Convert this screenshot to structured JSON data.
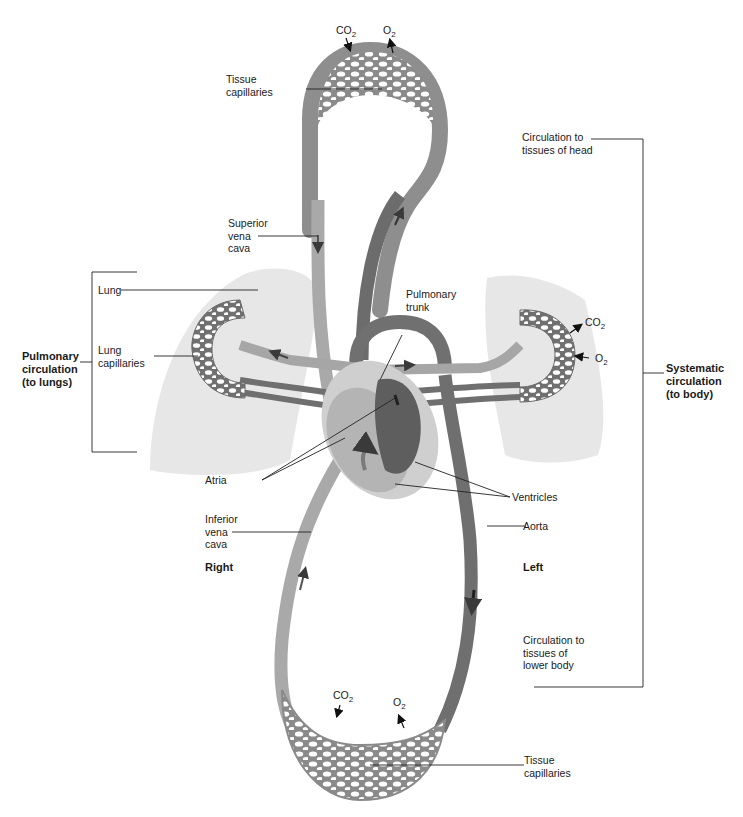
{
  "figure": {
    "type": "circulatory system schematic",
    "colors": {
      "background": "#ffffff",
      "deoxygenated_vessel": "#a8a8a8",
      "oxygenated_vessel": "#6e6e6e",
      "lung_tissue": "#e6e6e6",
      "capillary_holes": "#ffffff",
      "leader_lines": "#222222"
    }
  },
  "labels": {
    "tissue_capillaries_top": "Tissue\ncapillaries",
    "superior_vena_cava": "Superior\nvena\ncava",
    "lung": "Lung",
    "lung_capillaries": "Lung\ncapillaries",
    "pulmonary_circulation": "Pulmonary\ncirculation\n(to lungs)",
    "pulmonary_trunk": "Pulmonary\ntrunk",
    "atria": "Atria",
    "ventricles": "Ventricles",
    "inferior_vena_cava": "Inferior\nvena\ncava",
    "aorta": "Aorta",
    "right": "Right",
    "left": "Left",
    "circulation_head": "Circulation to\ntissues of head",
    "systematic_circulation": "Systematic\ncirculation\n(to body)",
    "circulation_lower_body": "Circulation to\ntissues of\nlower body",
    "tissue_capillaries_bottom": "Tissue\ncapillaries"
  },
  "gases": {
    "top_co2": {
      "base": "CO",
      "sub": "2"
    },
    "top_o2": {
      "base": "O",
      "sub": "2"
    },
    "lung_co2": {
      "base": "CO",
      "sub": "2"
    },
    "lung_o2": {
      "base": "O",
      "sub": "2"
    },
    "bottom_co2": {
      "base": "CO",
      "sub": "2"
    },
    "bottom_o2": {
      "base": "O",
      "sub": "2"
    }
  }
}
